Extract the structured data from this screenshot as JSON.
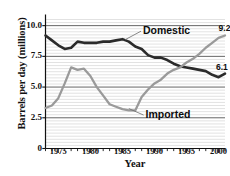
{
  "chart_data": {
    "type": "line",
    "title": "",
    "xlabel": "Year",
    "ylabel": "Barrels per day (millions)",
    "xlim": [
      1973,
      2001
    ],
    "ylim": [
      0,
      10.5
    ],
    "yticks": [
      "0",
      "2.5",
      "5.0",
      "7.5",
      "10.0"
    ],
    "ytick_values": [
      0,
      2.5,
      5.0,
      7.5,
      10.0
    ],
    "xticks": [
      "1975",
      "1980",
      "1985",
      "1990",
      "1995",
      "2000"
    ],
    "xtick_values": [
      1975,
      1980,
      1985,
      1990,
      1995,
      2000
    ],
    "grid": "horizontal-minor-and-major",
    "legend": "inline-annotations",
    "x": [
      1973,
      1974,
      1975,
      1976,
      1977,
      1978,
      1979,
      1980,
      1981,
      1982,
      1983,
      1984,
      1985,
      1986,
      1987,
      1988,
      1989,
      1990,
      1991,
      1992,
      1993,
      1994,
      1995,
      1996,
      1997,
      1998,
      1999,
      2000,
      2001
    ],
    "series": [
      {
        "name": "Domestic",
        "color": "#2b2b2b",
        "end_label": "6.1",
        "values": [
          9.2,
          8.8,
          8.4,
          8.1,
          8.2,
          8.7,
          8.6,
          8.6,
          8.6,
          8.7,
          8.7,
          8.8,
          8.9,
          8.7,
          8.3,
          8.1,
          7.6,
          7.4,
          7.4,
          7.2,
          6.9,
          6.7,
          6.6,
          6.5,
          6.4,
          6.3,
          6.0,
          5.8,
          6.1
        ]
      },
      {
        "name": "Imported",
        "color": "#9a9a9a",
        "end_label": "9.2",
        "values": [
          3.3,
          3.5,
          4.1,
          5.3,
          6.6,
          6.4,
          6.5,
          5.9,
          5.0,
          4.3,
          3.6,
          3.4,
          3.2,
          3.1,
          3.1,
          4.2,
          4.8,
          5.3,
          5.6,
          6.1,
          6.4,
          6.6,
          7.0,
          7.3,
          7.7,
          8.2,
          8.6,
          9.0,
          9.2
        ]
      }
    ],
    "annotations": [
      {
        "text": "Domestic",
        "target_series": "Domestic"
      },
      {
        "text": "Imported",
        "target_series": "Imported"
      }
    ]
  }
}
